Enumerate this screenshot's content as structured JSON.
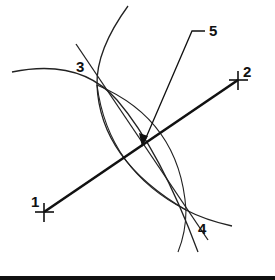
{
  "figure": {
    "labels": {
      "p1": "1",
      "p2": "2",
      "p3": "3",
      "p4": "4",
      "p5": "5"
    },
    "colors": {
      "ink": "#111111",
      "background": "#ffffff"
    },
    "points": {
      "p1": [
        44,
        212
      ],
      "p2": [
        238,
        80
      ],
      "p3": [
        97,
        85
      ],
      "p4": [
        186,
        210
      ],
      "midpoint": [
        141,
        146
      ]
    },
    "elements": [
      {
        "id": "segment-1-2",
        "type": "line",
        "weight": "thick",
        "from": "p1",
        "to": "p2"
      },
      {
        "id": "bisector-3-4",
        "type": "line",
        "weight": "thin",
        "through": [
          "p3",
          "p4"
        ]
      },
      {
        "id": "arc-from-1",
        "type": "arc",
        "center": "p1"
      },
      {
        "id": "arc-from-2",
        "type": "arc",
        "center": "p2"
      },
      {
        "id": "leader-5",
        "type": "leader-arrow",
        "target": "midpoint"
      }
    ]
  }
}
